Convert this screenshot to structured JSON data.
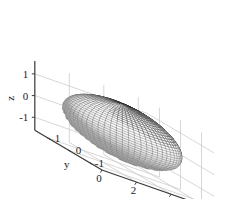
{
  "figure": {
    "title": "",
    "width": 230,
    "height": 199,
    "background": "#ffffff"
  },
  "chart_data": {
    "type": "surface3d",
    "title": "",
    "subtitle": "",
    "projection": {
      "azimuth_deg": -37.5,
      "elevation_deg": 30
    },
    "axes": {
      "x": {
        "label": "x",
        "ticks": [
          0,
          2,
          4,
          6
        ],
        "tick_labels": [
          "0",
          "2",
          "4",
          "6"
        ],
        "range": [
          0,
          6.5
        ]
      },
      "y": {
        "label": "y",
        "ticks": [
          -1,
          0,
          1
        ],
        "tick_labels": [
          "-1",
          "0",
          "1"
        ],
        "range": [
          -1.6,
          1.6
        ]
      },
      "z": {
        "label": "z",
        "ticks": [
          -1,
          0,
          1
        ],
        "tick_labels": [
          "-1",
          "0",
          "1"
        ],
        "range": [
          -1.6,
          1.6
        ]
      },
      "grid": true,
      "box": true
    },
    "legend": {
      "visible": false,
      "entries": []
    },
    "surface": {
      "shape": "ellipsoid",
      "center": [
        3.1,
        0.0,
        0.05
      ],
      "semi_axes": [
        3.0,
        1.45,
        1.35
      ],
      "tilt_deg": 0,
      "mesh_u_divisions": 60,
      "mesh_v_divisions": 40,
      "wireframe_color": "#2b2b2b",
      "face_color": "#ffffff",
      "shading": "lighted-from-upper-right"
    },
    "colors": {
      "grid_line": "#c9c9c9",
      "axis_line": "#3a3a3a",
      "mesh_line": "#303030",
      "text": "#1a1a1a",
      "background": "#ffffff"
    }
  },
  "labels": {
    "x_axis": "x",
    "y_axis": "y",
    "z_axis": "z",
    "x_ticks": [
      "0",
      "2",
      "4",
      "6"
    ],
    "y_ticks": [
      "1",
      "0",
      "-1"
    ],
    "z_ticks": [
      "1",
      "0",
      "-1"
    ]
  }
}
